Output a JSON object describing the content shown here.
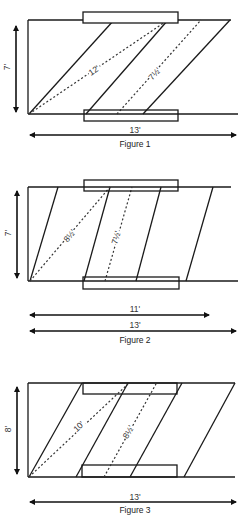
{
  "figures": [
    {
      "caption": "Figure 1",
      "height_label": "7'",
      "width_labels": [
        "13'"
      ],
      "diagonals": [
        {
          "label": "12'"
        },
        {
          "label": "10'"
        }
      ],
      "plank_count": 3,
      "supports": "overlapping-edges"
    },
    {
      "caption": "Figure 2",
      "height_label": "7'",
      "width_labels": [
        "11'",
        "13'"
      ],
      "diagonals": [
        {
          "label": "8½'"
        },
        {
          "label": "7½'"
        }
      ],
      "plank_count": 4,
      "supports": "overlapping-edges"
    },
    {
      "caption": "Figure 3",
      "height_label": "8'",
      "width_labels": [
        "13'"
      ],
      "diagonals": [
        {
          "label": "10'"
        },
        {
          "label": "8½'"
        }
      ],
      "plank_count": 4,
      "supports": "inside-edges"
    }
  ]
}
